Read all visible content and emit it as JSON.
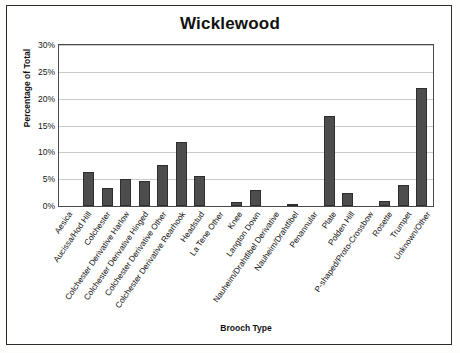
{
  "chart_data": {
    "type": "bar",
    "title": "Wicklewood",
    "xlabel": "Brooch Type",
    "ylabel": "Percentage of Total",
    "ylim": [
      0,
      30
    ],
    "grid": true,
    "legend": "none",
    "ytick_labels": [
      "0%",
      "5%",
      "10%",
      "15%",
      "20%",
      "25%",
      "30%"
    ],
    "ytick_values": [
      0,
      5,
      10,
      15,
      20,
      25,
      30
    ],
    "categories": [
      "Aesica",
      "Aucissa/Hod Hill",
      "Colchester",
      "Colchester Derivative Harlow",
      "Colchester Derivative Hinged",
      "Colchester Derivative Other",
      "Colchester Derivative Rearhook",
      "Headstud",
      "La Tene Other",
      "Knee",
      "Langton Down",
      "Nauheim/Drahtfibel Derivative",
      "Nauheim/Drahtfibel",
      "Penannular",
      "Plate",
      "Polden Hill",
      "P-shaped/Proto-Crossbow",
      "Rosette",
      "Trumpet",
      "Unknown/Other"
    ],
    "values": [
      0,
      6.3,
      3.3,
      5.0,
      4.7,
      7.7,
      12.0,
      5.5,
      0,
      0.7,
      3.0,
      0,
      0.3,
      0,
      16.8,
      2.5,
      0,
      1.0,
      4.0,
      22.0
    ]
  },
  "colors": {
    "bar_fill": "#4d4d4d",
    "bar_stroke": "#2e2e2e",
    "grid": "#c9c9c9",
    "axis": "#4a4a4a",
    "text": "#121212",
    "background": "#ffffff"
  }
}
